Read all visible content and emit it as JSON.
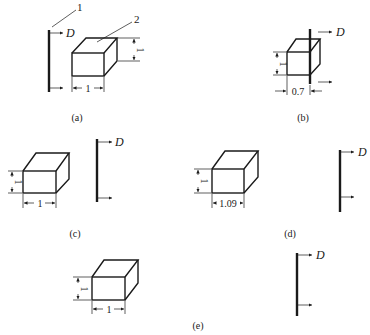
{
  "figure": {
    "panels": [
      {
        "id": "a",
        "caption": "(a)",
        "width_label": "1",
        "height_label": "1",
        "detector_label": "D",
        "callouts": [
          "1",
          "2"
        ]
      },
      {
        "id": "b",
        "caption": "(b)",
        "width_label": "0.7",
        "height_label": "1",
        "detector_label": "D"
      },
      {
        "id": "c",
        "caption": "(c)",
        "width_label": "1",
        "height_label": "1",
        "detector_label": "D"
      },
      {
        "id": "d",
        "caption": "(d)",
        "width_label": "1.09",
        "height_label": "1",
        "detector_label": "D"
      },
      {
        "id": "e",
        "caption": "(e)",
        "width_label": "1",
        "height_label": "1",
        "detector_label": "D"
      }
    ],
    "callout_1": "1",
    "callout_2": "2"
  }
}
